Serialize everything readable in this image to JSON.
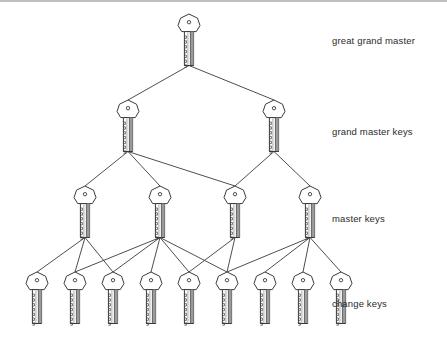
{
  "diagram": {
    "type": "tree",
    "background_color": "#ffffff",
    "stroke_color": "#3a3a3a",
    "key_fill": "#ffffff",
    "key_shadow": "#9a9a9a",
    "levels": [
      {
        "id": "great-grand-master",
        "label": "great grand master",
        "label_x": 332,
        "label_y": 35,
        "count": 1,
        "key_y": 14,
        "keys": [
          {
            "x": 189
          }
        ]
      },
      {
        "id": "grand-master-keys",
        "label": "grand master keys",
        "label_x": 332,
        "label_y": 126,
        "count": 2,
        "key_y": 100,
        "keys": [
          {
            "x": 128
          },
          {
            "x": 274
          }
        ]
      },
      {
        "id": "master-keys",
        "label": "master keys",
        "label_x": 332,
        "label_y": 213,
        "count": 4,
        "key_y": 186,
        "keys": [
          {
            "x": 85
          },
          {
            "x": 160
          },
          {
            "x": 235
          },
          {
            "x": 310
          }
        ]
      },
      {
        "id": "change-keys",
        "label": "change keys",
        "label_x": 332,
        "label_y": 298,
        "count": 9,
        "key_y": 272,
        "keys": [
          {
            "x": 37
          },
          {
            "x": 75
          },
          {
            "x": 113
          },
          {
            "x": 151
          },
          {
            "x": 189
          },
          {
            "x": 227
          },
          {
            "x": 265
          },
          {
            "x": 303
          },
          {
            "x": 341
          }
        ]
      }
    ],
    "edges": [
      {
        "from": "great-grand-master.0",
        "to": "grand-master-keys.0"
      },
      {
        "from": "great-grand-master.0",
        "to": "grand-master-keys.1"
      },
      {
        "from": "grand-master-keys.0",
        "to": "master-keys.0"
      },
      {
        "from": "grand-master-keys.0",
        "to": "master-keys.1"
      },
      {
        "from": "grand-master-keys.0",
        "to": "master-keys.2"
      },
      {
        "from": "grand-master-keys.1",
        "to": "master-keys.2"
      },
      {
        "from": "grand-master-keys.1",
        "to": "master-keys.3"
      },
      {
        "from": "master-keys.0",
        "to": "change-keys.0"
      },
      {
        "from": "master-keys.0",
        "to": "change-keys.1"
      },
      {
        "from": "master-keys.0",
        "to": "change-keys.2"
      },
      {
        "from": "master-keys.1",
        "to": "change-keys.1"
      },
      {
        "from": "master-keys.1",
        "to": "change-keys.2"
      },
      {
        "from": "master-keys.1",
        "to": "change-keys.3"
      },
      {
        "from": "master-keys.1",
        "to": "change-keys.4"
      },
      {
        "from": "master-keys.1",
        "to": "change-keys.5"
      },
      {
        "from": "master-keys.2",
        "to": "change-keys.4"
      },
      {
        "from": "master-keys.2",
        "to": "change-keys.5"
      },
      {
        "from": "master-keys.3",
        "to": "change-keys.5"
      },
      {
        "from": "master-keys.3",
        "to": "change-keys.6"
      },
      {
        "from": "master-keys.3",
        "to": "change-keys.7"
      },
      {
        "from": "master-keys.3",
        "to": "change-keys.8"
      }
    ]
  }
}
